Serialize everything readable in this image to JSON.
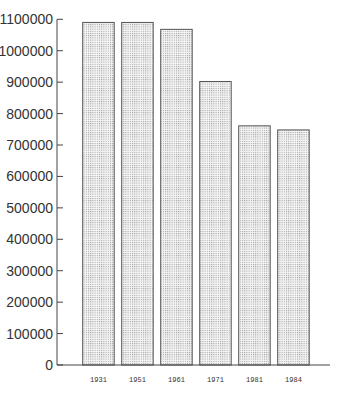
{
  "chart_data": {
    "type": "bar",
    "title": "",
    "xlabel": "",
    "ylabel": "",
    "categories": [
      "1931",
      "1951",
      "1961",
      "1971",
      "1981",
      "1984"
    ],
    "values": [
      1090000,
      1090000,
      1068000,
      902000,
      761000,
      748000
    ],
    "ylim": [
      0,
      1100000
    ],
    "yticks": [
      0,
      100000,
      200000,
      300000,
      400000,
      500000,
      600000,
      700000,
      800000,
      900000,
      1000000,
      1100000
    ],
    "ytick_labels": [
      "0",
      "100000",
      "200000",
      "300000",
      "400000",
      "500000",
      "600000",
      "700000",
      "800000",
      "900000",
      "1000000",
      "1100000"
    ],
    "grid": false,
    "legend": null,
    "bar_fill": "dotted-light-gray",
    "bar_edge_color": "#555555"
  }
}
